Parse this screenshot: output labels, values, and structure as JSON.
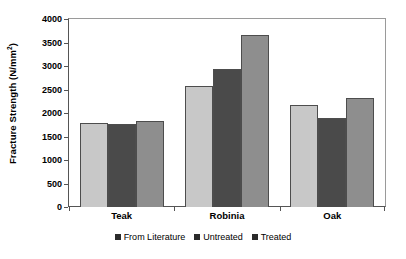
{
  "chart_data": {
    "type": "bar",
    "title": "",
    "xlabel": "",
    "ylabel": "Fracture Strength (N/mm2)",
    "ylabel_display": "Fracture Strength (N/mm",
    "ylabel_sup": "2",
    "ylabel_tail": ")",
    "categories": [
      "Teak",
      "Robinia",
      "Oak"
    ],
    "series": [
      {
        "name": "From Literature",
        "color": "#c8c8c8",
        "values": [
          1790,
          2580,
          2160
        ]
      },
      {
        "name": "Untreated",
        "color": "#4a4a4a",
        "values": [
          1770,
          2930,
          1900
        ]
      },
      {
        "name": "Treated",
        "color": "#8e8e8e",
        "values": [
          1830,
          3670,
          2310
        ]
      }
    ],
    "ylim": [
      0,
      4000
    ],
    "ytick_step": 500,
    "yticks": [
      0,
      500,
      1000,
      1500,
      2000,
      2500,
      3000,
      3500,
      4000
    ],
    "ytick_labels": [
      "0",
      "500",
      "1000",
      "1500",
      "2000",
      "2500",
      "3000",
      "3500",
      "4000"
    ],
    "grid": false,
    "legend_position": "bottom",
    "legend_marker": "filled-square",
    "legend_marker_color": "#2b2b2b",
    "axis_color": "#555555",
    "bar_border_color": "#4d4d4d",
    "background": "#ffffff"
  }
}
